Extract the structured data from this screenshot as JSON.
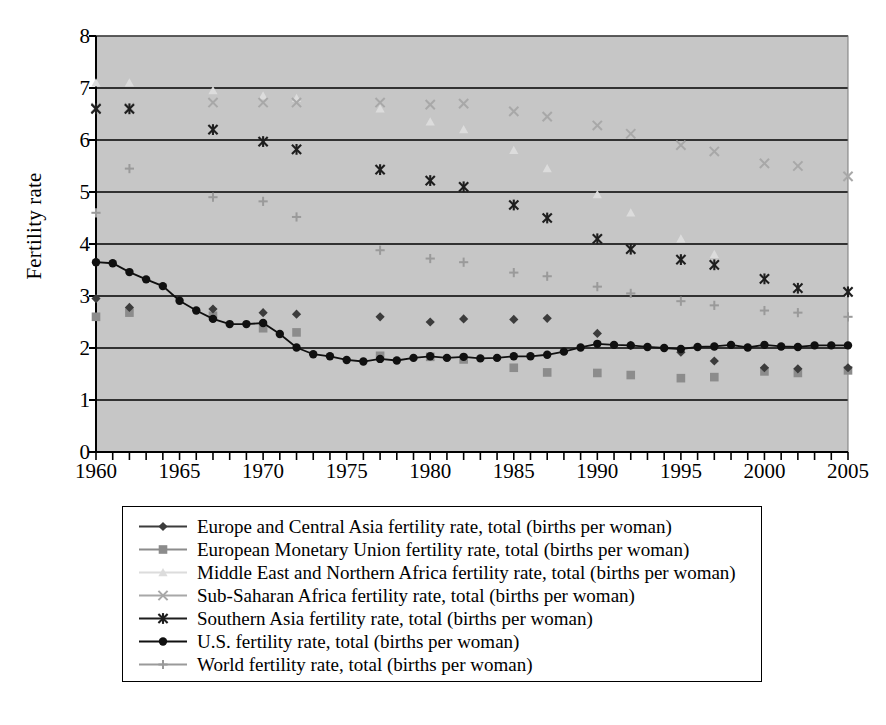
{
  "chart_data": {
    "type": "scatter",
    "title": "",
    "xlabel": "",
    "ylabel": "Fertility rate",
    "xlim": [
      1960,
      2005
    ],
    "ylim": [
      0,
      8
    ],
    "grid": true,
    "legend_position": "bottom",
    "x_ticks_major": [
      1960,
      1965,
      1970,
      1975,
      1980,
      1985,
      1990,
      1995,
      2000,
      2005
    ],
    "x_ticks_minor_step": 1,
    "y_ticks": [
      0,
      1,
      2,
      3,
      4,
      5,
      6,
      7,
      8
    ],
    "plot_background": "#c6c6c6",
    "series": [
      {
        "name": "Europe and Central Asia fertility rate, total (births per woman)",
        "short": "Europe and Central Asia",
        "marker": "diamond",
        "color": "#3c3c3c",
        "line": true,
        "x": [
          1960,
          1962,
          1967,
          1970,
          1972,
          1977,
          1980,
          1982,
          1985,
          1987,
          1990,
          1992,
          1995,
          1997,
          2000,
          2002,
          2005
        ],
        "y": [
          2.95,
          2.78,
          2.75,
          2.68,
          2.65,
          2.6,
          2.5,
          2.56,
          2.55,
          2.57,
          2.28,
          2.05,
          1.92,
          1.75,
          1.62,
          1.6,
          1.62
        ]
      },
      {
        "name": "European Monetary Union fertility rate, total (births per woman)",
        "short": "European Monetary Union",
        "marker": "square",
        "color": "#8c8c8c",
        "line": true,
        "x": [
          1960,
          1962,
          1967,
          1970,
          1972,
          1977,
          1980,
          1982,
          1985,
          1987,
          1990,
          1992,
          1995,
          1997,
          2000,
          2002,
          2005
        ],
        "y": [
          2.6,
          2.68,
          2.62,
          2.38,
          2.3,
          1.85,
          1.83,
          1.78,
          1.62,
          1.53,
          1.52,
          1.48,
          1.42,
          1.44,
          1.55,
          1.52,
          1.57
        ]
      },
      {
        "name": "Middle East and Northern Africa fertility rate, total (births per woman)",
        "short": "Middle East and Northern Africa",
        "marker": "triangle",
        "color": "#dcdcdc",
        "line": false,
        "x": [
          1960,
          1962,
          1967,
          1970,
          1972,
          1977,
          1980,
          1982,
          1985,
          1987,
          1990,
          1992,
          1995,
          1997,
          2000,
          2002,
          2005
        ],
        "y": [
          7.1,
          7.1,
          6.95,
          6.85,
          6.8,
          6.6,
          6.35,
          6.2,
          5.8,
          5.45,
          4.95,
          4.6,
          4.1,
          3.8,
          3.35,
          3.2,
          3.05
        ]
      },
      {
        "name": "Sub-Saharan Africa fertility rate, total (births per woman)",
        "short": "Sub-Saharan Africa",
        "marker": "cross",
        "color": "#a8a8a8",
        "line": false,
        "x": [
          1960,
          1962,
          1967,
          1970,
          1972,
          1977,
          1980,
          1982,
          1985,
          1987,
          1990,
          1992,
          1995,
          1997,
          2000,
          2002,
          2005
        ],
        "y": [
          6.62,
          6.62,
          6.72,
          6.72,
          6.72,
          6.72,
          6.68,
          6.7,
          6.55,
          6.45,
          6.28,
          6.12,
          5.9,
          5.78,
          5.55,
          5.5,
          5.3
        ]
      },
      {
        "name": "Southern Asia fertility rate, total (births per woman)",
        "short": "Southern Asia",
        "marker": "asterisk",
        "color": "#1e1e1e",
        "line": false,
        "x": [
          1960,
          1962,
          1967,
          1970,
          1972,
          1977,
          1980,
          1982,
          1985,
          1987,
          1990,
          1992,
          1995,
          1997,
          2000,
          2002,
          2005
        ],
        "y": [
          6.6,
          6.6,
          6.2,
          5.97,
          5.82,
          5.43,
          5.22,
          5.1,
          4.75,
          4.5,
          4.1,
          3.9,
          3.7,
          3.6,
          3.33,
          3.15,
          3.08
        ]
      },
      {
        "name": "U.S. fertility rate, total (births per woman)",
        "short": "U.S.",
        "marker": "circle",
        "color": "#101010",
        "line": true,
        "x": [
          1960,
          1961,
          1962,
          1963,
          1964,
          1965,
          1966,
          1967,
          1968,
          1969,
          1970,
          1971,
          1972,
          1973,
          1974,
          1975,
          1976,
          1977,
          1978,
          1979,
          1980,
          1981,
          1982,
          1983,
          1984,
          1985,
          1986,
          1987,
          1988,
          1989,
          1990,
          1991,
          1992,
          1993,
          1994,
          1995,
          1996,
          1997,
          1998,
          1999,
          2000,
          2001,
          2002,
          2003,
          2004,
          2005
        ],
        "y": [
          3.65,
          3.63,
          3.46,
          3.32,
          3.19,
          2.91,
          2.72,
          2.56,
          2.46,
          2.46,
          2.48,
          2.27,
          2.01,
          1.88,
          1.84,
          1.77,
          1.74,
          1.79,
          1.76,
          1.81,
          1.84,
          1.81,
          1.83,
          1.8,
          1.81,
          1.84,
          1.84,
          1.87,
          1.93,
          2.01,
          2.08,
          2.06,
          2.05,
          2.02,
          2.0,
          1.98,
          2.02,
          2.03,
          2.06,
          2.01,
          2.06,
          2.03,
          2.02,
          2.05,
          2.05,
          2.05
        ]
      },
      {
        "name": "World fertility rate, total (births per woman)",
        "short": "World",
        "marker": "plus",
        "color": "#9a9a9a",
        "line": false,
        "x": [
          1960,
          1962,
          1967,
          1970,
          1972,
          1977,
          1980,
          1982,
          1985,
          1987,
          1990,
          1992,
          1995,
          1997,
          2000,
          2002,
          2005
        ],
        "y": [
          4.6,
          5.45,
          4.9,
          4.82,
          4.52,
          3.88,
          3.72,
          3.65,
          3.45,
          3.38,
          3.18,
          3.05,
          2.9,
          2.82,
          2.72,
          2.68,
          2.6
        ]
      }
    ]
  },
  "axis": {
    "y_title": "Fertility rate",
    "y_tick_labels": [
      "0",
      "1",
      "2",
      "3",
      "4",
      "5",
      "6",
      "7",
      "8"
    ],
    "x_tick_labels": [
      "1960",
      "1965",
      "1970",
      "1975",
      "1980",
      "1985",
      "1990",
      "1995",
      "2000",
      "2005"
    ]
  },
  "legend": {
    "entries": [
      {
        "label": "Europe and Central Asia fertility rate, total (births per woman)",
        "marker": "diamond",
        "color": "#3c3c3c",
        "line": true
      },
      {
        "label": "European Monetary Union fertility rate, total (births per woman)",
        "marker": "square",
        "color": "#8c8c8c",
        "line": true
      },
      {
        "label": "Middle East and Northern Africa fertility rate, total (births per woman)",
        "marker": "triangle",
        "color": "#dcdcdc",
        "line": true
      },
      {
        "label": "Sub-Saharan Africa fertility rate, total (births per woman)",
        "marker": "cross",
        "color": "#a8a8a8",
        "line": true
      },
      {
        "label": "Southern Asia fertility rate, total (births per woman)",
        "marker": "asterisk",
        "color": "#1e1e1e",
        "line": true
      },
      {
        "label": "U.S. fertility rate, total (births per woman)",
        "marker": "circle",
        "color": "#101010",
        "line": true
      },
      {
        "label": "World fertility rate, total (births per woman)",
        "marker": "plus",
        "color": "#9a9a9a",
        "line": true
      }
    ]
  }
}
